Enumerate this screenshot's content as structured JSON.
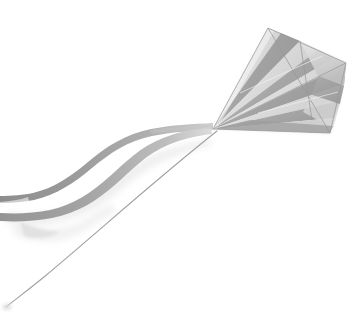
{
  "image": {
    "subject": "kite",
    "scene_description": "A gray and white striped delta/parafoil kite flying against a plain white background, with two long ribbon tails streaming to the left and a thin flying line running down to the lower-left corner.",
    "width": 356,
    "height": 331,
    "background_color": "#ffffff",
    "orientation": "landscape-ish",
    "palette": {
      "background": "#ffffff",
      "sail_light": "#e3e3e3",
      "sail_midlight": "#d2d2d2",
      "sail_mid": "#bcbcbc",
      "sail_dark": "#a3a3a3",
      "sail_darker": "#8f8f8f",
      "spar_line": "#9a9a9a",
      "tail_ribbon": "#989898",
      "tail_ribbon_dark": "#868686",
      "tail_shadow": "#e0e0e0",
      "flying_line": "#9d9d9d"
    }
  },
  "objects": {
    "kite": {
      "label": "striped kite sail",
      "nose_point": {
        "x": 213,
        "y": 129
      },
      "apex_point": {
        "x": 271,
        "y": 28
      },
      "right_tip": {
        "x": 345,
        "y": 63
      },
      "lower_tip": {
        "x": 330,
        "y": 133
      },
      "stripe_count": 7,
      "stripe_pattern": "alternating gray and white wedges radiating from the nose"
    },
    "tails": {
      "label": "kite ribbon tails",
      "count": 2,
      "direction": "flowing left from the kite nose, S-curved",
      "exit_edge": "left"
    },
    "flying_line": {
      "label": "kite flying line",
      "start": {
        "x": 217,
        "y": 131
      },
      "end": {
        "x": 6,
        "y": 307
      },
      "thickness_px": 1
    },
    "shadow": {
      "label": "soft ribbon shadow",
      "color": "#e4e4e4"
    }
  }
}
